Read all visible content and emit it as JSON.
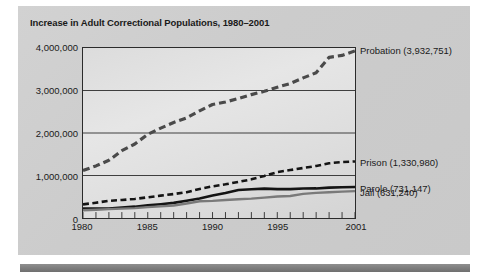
{
  "figure": {
    "title": "Increase in Adult Correctional Populations, 1980–2001",
    "background_color": "#cccccc",
    "plot_background_color": "#e0e0e0",
    "frame_color": "#2b2b2b",
    "bottom_rule_color": "#7e7e7e"
  },
  "axes": {
    "y_ticks": [
      {
        "label": "4,000,000",
        "value": 4000000
      },
      {
        "label": "3,000,000",
        "value": 3000000
      },
      {
        "label": "2,000,000",
        "value": 2000000
      },
      {
        "label": "1,000,000",
        "value": 1000000
      },
      {
        "label": "0",
        "value": 0
      }
    ],
    "x_ticks": [
      {
        "label": "1980",
        "value": 1980
      },
      {
        "label": "1985",
        "value": 1985
      },
      {
        "label": "1990",
        "value": 1990
      },
      {
        "label": "1995",
        "value": 1995
      },
      {
        "label": "2001",
        "value": 2001
      }
    ]
  },
  "series_labels": [
    {
      "text": "Probation (3,932,751)",
      "value_at_y": 3932751
    },
    {
      "text": "Prison (1,330,980)",
      "value_at_y": 1330980
    },
    {
      "text": "Parole (731,147)",
      "value_at_y": 731147
    },
    {
      "text": "Jail (631,240)",
      "value_at_y": 631240
    }
  ],
  "chart_data": {
    "type": "line",
    "title": "Increase in Adult Correctional Populations, 1980–2001",
    "xlabel": "",
    "ylabel": "",
    "xlim": [
      1980,
      2001
    ],
    "ylim": [
      0,
      4000000
    ],
    "grid": "horizontal",
    "legend_position": "right-inline-end-labels",
    "x": [
      1980,
      1981,
      1982,
      1983,
      1984,
      1985,
      1986,
      1987,
      1988,
      1989,
      1990,
      1991,
      1992,
      1993,
      1994,
      1995,
      1996,
      1997,
      1998,
      1999,
      2000,
      2001
    ],
    "series": [
      {
        "name": "Probation",
        "end_label": "Probation (3,932,751)",
        "style": "dashed",
        "color": "#4a4a4a",
        "width": 3.2,
        "final_value": 3932751,
        "values": [
          1118097,
          1225934,
          1357264,
          1582947,
          1740948,
          1968712,
          2114621,
          2247158,
          2356483,
          2522125,
          2670234,
          2728472,
          2811611,
          2903061,
          2981022,
          3077861,
          3164996,
          3296513,
          3417613,
          3779922,
          3826209,
          3932751
        ]
      },
      {
        "name": "Prison",
        "end_label": "Prison (1,330,980)",
        "style": "dashed",
        "color": "#141414",
        "width": 2.6,
        "final_value": 1330980,
        "values": [
          319598,
          360029,
          402914,
          423898,
          448264,
          487593,
          526436,
          562814,
          607766,
          683367,
          743382,
          792535,
          850566,
          909381,
          990147,
          1078542,
          1127528,
          1176564,
          1224469,
          1287172,
          1316333,
          1330980
        ]
      },
      {
        "name": "Parole",
        "end_label": "Parole (731,147)",
        "style": "solid",
        "color": "#141414",
        "width": 2.6,
        "final_value": 731147,
        "values": [
          220438,
          225539,
          224604,
          246440,
          266992,
          300203,
          325638,
          355505,
          407977,
          456803,
          531407,
          590442,
          658601,
          676100,
          690371,
          679421,
          679733,
          694787,
          696385,
          714457,
          725527,
          731147
        ]
      },
      {
        "name": "Jail",
        "end_label": "Jail (631,240)",
        "style": "solid",
        "color": "#7a7a7a",
        "width": 2.4,
        "final_value": 631240,
        "values": [
          182288,
          195085,
          207853,
          221815,
          233018,
          254986,
          272736,
          294092,
          341893,
          393303,
          403019,
          424129,
          441781,
          455500,
          479800,
          507044,
          518492,
          567079,
          592462,
          605943,
          621149,
          631240
        ]
      }
    ]
  }
}
